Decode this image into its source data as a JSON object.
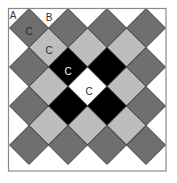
{
  "diagram": {
    "frame": {
      "x": 8.5,
      "y": 8.5,
      "width": 157.5,
      "height": 162.5
    },
    "half_size": 19.5,
    "colors": {
      "dark": "#6f6f6f",
      "light": "#bdbdbd",
      "black": "#000000",
      "white": "#ffffff",
      "frame": "#8a8a8a"
    },
    "tiles": [
      {
        "cx": 29,
        "cy": 28,
        "fill": "dark"
      },
      {
        "cx": 68,
        "cy": 28,
        "fill": "dark"
      },
      {
        "cx": 107,
        "cy": 28,
        "fill": "dark"
      },
      {
        "cx": 146,
        "cy": 28,
        "fill": "dark"
      },
      {
        "cx": 48.5,
        "cy": 47.5,
        "fill": "light"
      },
      {
        "cx": 87.5,
        "cy": 47.5,
        "fill": "light"
      },
      {
        "cx": 126.5,
        "cy": 47.5,
        "fill": "light"
      },
      {
        "cx": 29,
        "cy": 67,
        "fill": "dark"
      },
      {
        "cx": 68,
        "cy": 67,
        "fill": "black"
      },
      {
        "cx": 107,
        "cy": 67,
        "fill": "black"
      },
      {
        "cx": 146,
        "cy": 67,
        "fill": "dark"
      },
      {
        "cx": 48.5,
        "cy": 86.5,
        "fill": "light"
      },
      {
        "cx": 87.5,
        "cy": 86.5,
        "fill": "white"
      },
      {
        "cx": 126.5,
        "cy": 86.5,
        "fill": "light"
      },
      {
        "cx": 29,
        "cy": 106,
        "fill": "dark"
      },
      {
        "cx": 68,
        "cy": 106,
        "fill": "black"
      },
      {
        "cx": 107,
        "cy": 106,
        "fill": "black"
      },
      {
        "cx": 146,
        "cy": 106,
        "fill": "dark"
      },
      {
        "cx": 48.5,
        "cy": 125.5,
        "fill": "light"
      },
      {
        "cx": 87.5,
        "cy": 125.5,
        "fill": "light"
      },
      {
        "cx": 126.5,
        "cy": 125.5,
        "fill": "light"
      },
      {
        "cx": 29,
        "cy": 145,
        "fill": "dark"
      },
      {
        "cx": 68,
        "cy": 145,
        "fill": "dark"
      },
      {
        "cx": 107,
        "cy": 145,
        "fill": "dark"
      },
      {
        "cx": 146,
        "cy": 145,
        "fill": "dark"
      }
    ],
    "labels": [
      {
        "text": "A",
        "x": 13,
        "y": 15,
        "color": "#333333"
      },
      {
        "text": "B",
        "x": 49,
        "y": 17,
        "color": "#333333"
      },
      {
        "text": "C",
        "x": 29,
        "y": 31,
        "color": "#2a2a2a"
      },
      {
        "text": "C",
        "x": 49,
        "y": 50,
        "color": "#2a2a2a"
      },
      {
        "text": "C",
        "x": 68,
        "y": 71,
        "color": "#ffffff"
      },
      {
        "text": "C",
        "x": 89,
        "y": 91,
        "color": "#2a2a2a"
      }
    ]
  }
}
